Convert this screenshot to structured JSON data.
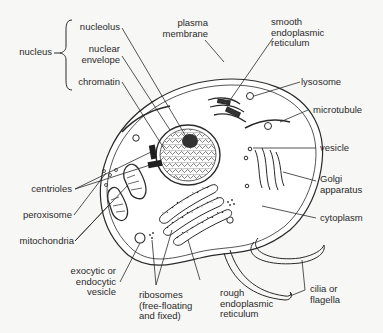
{
  "diagram": {
    "colors": {
      "ink": "#2a2a2a",
      "background": "#f7f7f5",
      "fill": "#ffffff"
    },
    "labels": {
      "nucleus": "nucleus",
      "nucleolus": "nucleolus",
      "nuclear_envelope": "nuclear\nenvelope",
      "chromatin": "chromatin",
      "plasma_membrane": "plasma\nmembrane",
      "smooth_er": "smooth\nendoplasmic\nreticulum",
      "lysosome": "lysosome",
      "microtubule": "microtubule",
      "centrioles": "centrioles",
      "peroxisome": "peroxisome",
      "mitochondria": "mitochondria",
      "vesicle": "vesicle",
      "golgi": "Golgi\napparatus",
      "cytoplasm": "cytoplasm",
      "exocytic_vesicle": "exocytic or\nendocytic\nvesicle",
      "ribosomes": "ribosomes\n(free-floating\nand fixed)",
      "rough_er": "rough\nendoplasmic\nreticulum",
      "cilia": "cilia or\nflagella"
    }
  }
}
